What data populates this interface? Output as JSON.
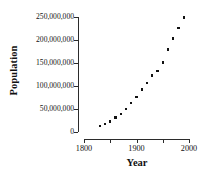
{
  "chart_data": {
    "type": "scatter",
    "title": "",
    "xlabel": "Year",
    "ylabel": "Population",
    "xlim": [
      1800,
      2000
    ],
    "ylim": [
      0,
      250000000
    ],
    "grid": false,
    "legend": null,
    "marker": "square",
    "marker_color": "#111111",
    "axis_color": "#2b2b2b",
    "xticks": [
      1800,
      1850,
      1900,
      1950,
      2000
    ],
    "xtick_labels": [
      "1800",
      "",
      "1900",
      "",
      "2000"
    ],
    "yticks": [
      0,
      50000000,
      100000000,
      150000000,
      200000000,
      250000000
    ],
    "ytick_labels": [
      "0",
      "50,000,000",
      "100,000,000",
      "150,000,000",
      "200,000,000",
      "250,000,000"
    ],
    "x": [
      1830,
      1840,
      1850,
      1860,
      1870,
      1880,
      1890,
      1900,
      1910,
      1920,
      1930,
      1940,
      1950,
      1960,
      1970,
      1980,
      1990
    ],
    "y": [
      12866020,
      17069453,
      23191876,
      31443321,
      38558371,
      50189209,
      62979766,
      76212168,
      92228496,
      106021537,
      123202624,
      132164569,
      151325798,
      179323175,
      203211926,
      226545805,
      248709873
    ],
    "series": [
      {
        "name": "Population",
        "points": [
          {
            "x": 1830,
            "y": 12866020
          },
          {
            "x": 1840,
            "y": 17069453
          },
          {
            "x": 1850,
            "y": 23191876
          },
          {
            "x": 1860,
            "y": 31443321
          },
          {
            "x": 1870,
            "y": 38558371
          },
          {
            "x": 1880,
            "y": 50189209
          },
          {
            "x": 1890,
            "y": 62979766
          },
          {
            "x": 1900,
            "y": 76212168
          },
          {
            "x": 1910,
            "y": 92228496
          },
          {
            "x": 1920,
            "y": 106021537
          },
          {
            "x": 1930,
            "y": 123202624
          },
          {
            "x": 1940,
            "y": 132164569
          },
          {
            "x": 1950,
            "y": 151325798
          },
          {
            "x": 1960,
            "y": 179323175
          },
          {
            "x": 1970,
            "y": 203211926
          },
          {
            "x": 1980,
            "y": 226545805
          },
          {
            "x": 1990,
            "y": 248709873
          }
        ]
      }
    ]
  },
  "axes": {
    "ylabel_text": "Population",
    "xlabel_text": "Year"
  }
}
